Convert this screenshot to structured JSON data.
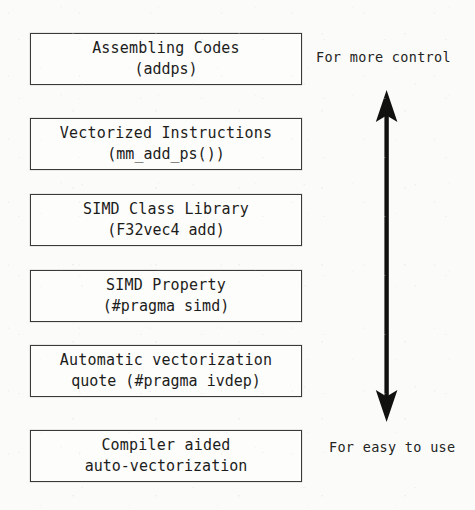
{
  "diagram": {
    "type": "vectorization-abstraction-ladder",
    "accent_color": "#1c1c1a",
    "border_color": "#3a3a38",
    "background_color": "#fbfbfa",
    "levels": [
      {
        "id": "assembling-codes",
        "line1": "Assembling Codes",
        "line2": "(addps)"
      },
      {
        "id": "vectorized-instructions",
        "line1": "Vectorized Instructions",
        "line2": "(mm_add_ps())"
      },
      {
        "id": "simd-class-library",
        "line1": "SIMD Class Library",
        "line2": "(F32vec4 add)"
      },
      {
        "id": "simd-property",
        "line1": "SIMD Property",
        "line2": "(#pragma simd)"
      },
      {
        "id": "automatic-vectorization",
        "line1": "Automatic vectorization",
        "line2": "quote (#pragma ivdep)"
      },
      {
        "id": "compiler-aided",
        "line1": "Compiler aided",
        "line2": "auto-vectorization"
      }
    ],
    "axis": {
      "top_label": "For more control",
      "bottom_label": "For easy to use",
      "arrow_style": "double-headed-vertical"
    }
  }
}
